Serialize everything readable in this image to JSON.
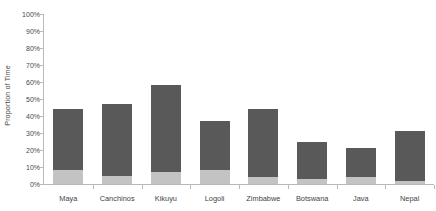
{
  "chart_data": {
    "type": "bar",
    "title": "",
    "subtitle": "",
    "xlabel": "",
    "ylabel": "Proportion of Time",
    "stacked": true,
    "grid": false,
    "legend": "none",
    "ylim": [
      0,
      100
    ],
    "y_tick_labels": [
      "0%",
      "10%",
      "20%",
      "30%",
      "40%",
      "50%",
      "60%",
      "70%",
      "80%",
      "90%",
      "100%"
    ],
    "y_tick_values": [
      0,
      10,
      20,
      30,
      40,
      50,
      60,
      70,
      80,
      90,
      100
    ],
    "categories": [
      "Maya",
      "Canchinos",
      "Kikuyu",
      "Logoli",
      "Zimbabwe",
      "Botswana",
      "Java",
      "Nepal"
    ],
    "series": [
      {
        "name": "lower-segment",
        "color": "#c3c3c3",
        "values": [
          8,
          5,
          7,
          8,
          4,
          3,
          4,
          2
        ]
      },
      {
        "name": "upper-segment",
        "color": "#595959",
        "values": [
          36,
          42,
          51,
          29,
          40,
          22,
          17,
          29
        ]
      }
    ],
    "totals": [
      44,
      47,
      58,
      37,
      44,
      25,
      21,
      31
    ]
  },
  "axis": {
    "y_title": "Proportion of Time"
  }
}
